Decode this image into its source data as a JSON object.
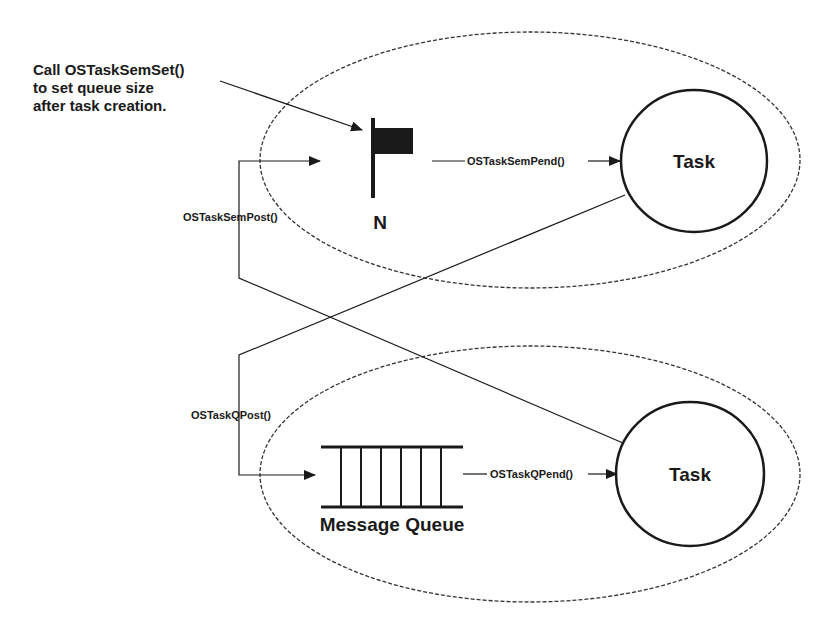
{
  "diagram": {
    "note": {
      "lines": [
        "Call OSTaskSemSet()",
        "to set queue size",
        "after task creation."
      ]
    },
    "semaphore": {
      "icon": "flag-icon",
      "label": "N"
    },
    "top_task": {
      "label": "Task"
    },
    "bottom_task": {
      "label": "Task"
    },
    "queue": {
      "icon": "message-queue-icon",
      "label": "Message Queue"
    },
    "edges": {
      "sem_pend": "OSTaskSemPend()",
      "sem_post": "OSTaskSemPost()",
      "q_post": "OSTaskQPost()",
      "q_pend": "OSTaskQPend()"
    },
    "colors": {
      "stroke": "#1a1a1a",
      "background": "#ffffff"
    }
  }
}
